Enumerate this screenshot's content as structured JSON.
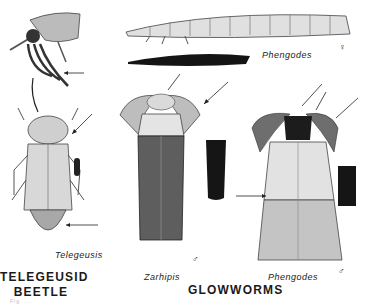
{
  "plate": {
    "groups": [
      {
        "heading_line1": "TELEGEUSID",
        "heading_line2": "BEETLE"
      },
      {
        "heading": "GLOWWORMS"
      }
    ],
    "specimens": [
      {
        "name": "Telegeusis",
        "view": "adult top view with mouthpart detail"
      },
      {
        "name": "Phengodes",
        "view": "larviform female",
        "sex_symbol": "♀"
      },
      {
        "name": "Zarhipis",
        "sex_symbol": "♂"
      },
      {
        "name": "Phengodes",
        "sex_symbol": "♂"
      }
    ],
    "footer_faint": "Fig. ..."
  },
  "colors": {
    "ink": "#1a1a1a",
    "shade": "#7a7a7a",
    "light_shade": "#c8c8c8",
    "background": "#ffffff"
  }
}
